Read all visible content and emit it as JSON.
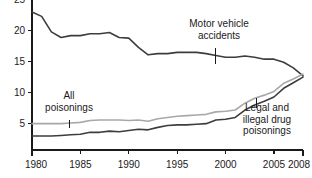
{
  "chart_data": {
    "type": "line",
    "title": "",
    "subtitle": "",
    "xlabel": "",
    "ylabel": "",
    "xlim": [
      1980,
      2008
    ],
    "ylim": [
      0,
      25
    ],
    "grid": false,
    "legend_position": "inline-annotations",
    "x_ticks": [
      "1980",
      "1985",
      "1990",
      "1995",
      "2000",
      "2005",
      "2008"
    ],
    "x_tick_values": [
      1980,
      1985,
      1990,
      1995,
      2000,
      2005,
      2008
    ],
    "y_ticks": [
      "5",
      "10",
      "15",
      "20",
      "25"
    ],
    "y_tick_values": [
      5,
      10,
      15,
      20,
      25
    ],
    "x": [
      1980,
      1981,
      1982,
      1983,
      1984,
      1985,
      1986,
      1987,
      1988,
      1989,
      1990,
      1991,
      1992,
      1993,
      1994,
      1995,
      1996,
      1997,
      1998,
      1999,
      2000,
      2001,
      2002,
      2003,
      2004,
      2005,
      2006,
      2007,
      2008
    ],
    "series": [
      {
        "name": "Motor vehicle accidents",
        "color": "#3d3d3d",
        "width": 1.6,
        "values": [
          23.0,
          22.3,
          19.8,
          18.9,
          19.2,
          19.2,
          19.5,
          19.5,
          19.7,
          18.9,
          18.8,
          17.3,
          16.1,
          16.3,
          16.3,
          16.5,
          16.5,
          16.5,
          16.3,
          16.0,
          15.7,
          15.7,
          15.9,
          15.7,
          15.4,
          15.4,
          14.9,
          14.0,
          12.7
        ],
        "label_note": "dark solid line, declining"
      },
      {
        "name": "All poisonings",
        "color": "#a8a8a8",
        "width": 1.6,
        "values": [
          5.0,
          5.0,
          5.0,
          5.0,
          5.1,
          5.2,
          5.5,
          5.6,
          5.6,
          5.6,
          5.5,
          5.6,
          5.4,
          5.8,
          6.0,
          6.2,
          6.3,
          6.4,
          6.5,
          6.9,
          7.0,
          7.2,
          8.3,
          9.1,
          9.6,
          10.2,
          11.5,
          12.2,
          13.0
        ],
        "label_note": "light gray solid line, rising"
      },
      {
        "name": "Legal and illegal drug poisonings",
        "color": "#3d3d3d",
        "width": 1.6,
        "values": [
          3.0,
          3.0,
          3.0,
          3.1,
          3.2,
          3.3,
          3.6,
          3.6,
          3.8,
          3.7,
          3.9,
          4.1,
          4.0,
          4.4,
          4.7,
          4.8,
          4.8,
          4.9,
          5.0,
          5.6,
          5.7,
          6.0,
          7.2,
          8.0,
          8.6,
          9.3,
          10.7,
          11.6,
          12.5
        ],
        "label_note": "dark solid line, rising"
      }
    ],
    "annotations": [
      {
        "id": "motor-vehicle-accidents",
        "lines": [
          "Motor vehicle",
          "accidents"
        ],
        "text_center_x": 219,
        "text_top_y": 27,
        "leader_x": 215,
        "leader_y_start": 48,
        "leader_y_end": 64
      },
      {
        "id": "all-poisonings",
        "lines": [
          "All",
          "poisonings"
        ],
        "text_center_x": 69,
        "text_top_y": 99,
        "leader_x": 69,
        "leader_y_start": 120,
        "leader_y_end": 128
      },
      {
        "id": "legal-illegal-drug-poisonings",
        "lines": [
          "Legal and",
          "illegal drug",
          "poisonings"
        ],
        "text_center_x": 267,
        "text_top_y": 111,
        "leader_x": 256,
        "leader_y_start": 98,
        "leader_y_end": 108
      }
    ],
    "colors": {
      "axis": "#1a1a1a",
      "text": "#1a1a1a",
      "background": "#ffffff",
      "series_dark": "#3d3d3d",
      "series_gray": "#a8a8a8"
    },
    "geometry": {
      "plot_left": 32,
      "plot_right": 303,
      "plot_bottom": 150,
      "y_value_at_bottom": 0.75,
      "y_pixels_per_unit": 6.2
    }
  }
}
